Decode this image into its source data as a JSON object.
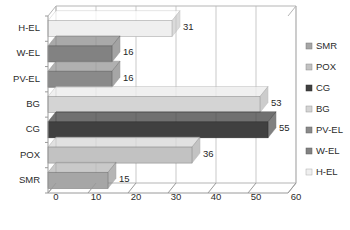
{
  "chart_data": {
    "type": "bar",
    "orientation": "horizontal",
    "title": "",
    "subtitle": "",
    "xlabel": "",
    "ylabel": "",
    "categories": [
      "SMR",
      "POX",
      "CG",
      "BG",
      "PV-EL",
      "W-EL",
      "H-EL"
    ],
    "values": [
      15,
      36,
      55,
      53,
      16,
      16,
      31
    ],
    "data_labels": [
      "15",
      "36",
      "55",
      "53",
      "16",
      "16",
      "31"
    ],
    "axis_display_order_top_to_bottom": [
      "H-EL",
      "W-EL",
      "PV-EL",
      "BG",
      "CG",
      "POX",
      "SMR"
    ],
    "xlim": [
      0,
      60
    ],
    "xticks": [
      0,
      10,
      20,
      30,
      40,
      50,
      60
    ],
    "xtick_labels": [
      "0",
      "10",
      "20",
      "30",
      "40",
      "50",
      "60"
    ],
    "grid": true,
    "grid_axis": "x",
    "legend_position": "right",
    "style": "3d-perspective",
    "series": [
      {
        "name": "SMR",
        "value": 15,
        "label": "15",
        "color": "#a6a6a6"
      },
      {
        "name": "POX",
        "value": 36,
        "label": "36",
        "color": "#c2c2c2"
      },
      {
        "name": "CG",
        "value": 55,
        "label": "55",
        "color": "#404040"
      },
      {
        "name": "BG",
        "value": 53,
        "label": "53",
        "color": "#d4d4d4"
      },
      {
        "name": "PV-EL",
        "value": 16,
        "label": "16",
        "color": "#8a8a8a"
      },
      {
        "name": "W-EL",
        "value": 16,
        "label": "16",
        "color": "#828282"
      },
      {
        "name": "H-EL",
        "value": 31,
        "label": "31",
        "color": "#efefef"
      }
    ]
  },
  "legend": {
    "entries": [
      {
        "label": "SMR",
        "color": "#a6a6a6"
      },
      {
        "label": "POX",
        "color": "#c2c2c2"
      },
      {
        "label": "CG",
        "color": "#404040"
      },
      {
        "label": "BG",
        "color": "#d4d4d4"
      },
      {
        "label": "PV-EL",
        "color": "#8a8a8a"
      },
      {
        "label": "W-EL",
        "color": "#828282"
      },
      {
        "label": "H-EL",
        "color": "#efefef"
      }
    ]
  },
  "axes": {
    "category_labels_top_to_bottom": [
      "H-EL",
      "W-EL",
      "PV-EL",
      "BG",
      "CG",
      "POX",
      "SMR"
    ],
    "x_tick_labels": [
      "0",
      "10",
      "20",
      "30",
      "40",
      "50",
      "60"
    ]
  },
  "colors": {
    "grid": "#c9c9c9",
    "axis": "#9a9a9a",
    "text": "#2b2b2b",
    "background": "#ffffff"
  }
}
